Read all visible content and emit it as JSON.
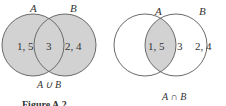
{
  "colors": {
    "shade": "#d2d2d2",
    "stroke": "#6a6a6a",
    "text": "#333333",
    "background": "#ffffff"
  },
  "diagrams": [
    {
      "name": "union",
      "set_a_label": "A",
      "set_b_label": "B",
      "only_a": "1, 5",
      "both": "3",
      "only_b": "2, 4",
      "caption": "A ∪ B",
      "shaded": "A union B"
    },
    {
      "name": "intersection",
      "set_a_label": "A",
      "set_b_label": "B",
      "only_a": "1, 5",
      "both": "3",
      "only_b": "2, 4",
      "caption": "A ∩ B",
      "shaded": "A intersect B"
    }
  ],
  "figure_caption": "Figure A.2"
}
